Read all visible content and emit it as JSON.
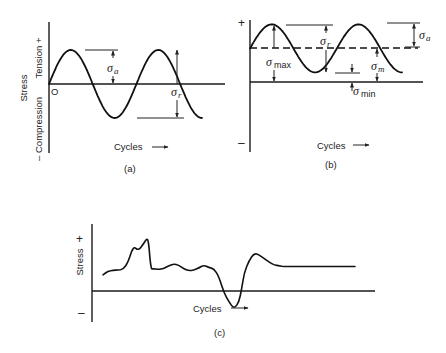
{
  "figure": {
    "panels": [
      {
        "id": "a",
        "caption": "(a)",
        "title": "Completely reversed stress cycle",
        "y_axis": {
          "label": "Stress",
          "positive_label": "Tension +",
          "negative_label": "– Compression"
        },
        "x_axis": {
          "label": "Cycles",
          "arrow": "→"
        },
        "origin_label": "O",
        "annotations": [
          {
            "symbol": "σ",
            "subscript": "a",
            "meaning": "stress amplitude"
          },
          {
            "symbol": "σ",
            "subscript": "r",
            "meaning": "stress range"
          }
        ]
      },
      {
        "id": "b",
        "caption": "(b)",
        "title": "Fluctuating stress cycle with nonzero mean",
        "y_axis": {
          "positive_label": "+",
          "negative_label": "–"
        },
        "x_axis": {
          "label": "Cycles",
          "arrow": "→"
        },
        "annotations": [
          {
            "symbol": "σ",
            "subscript": "r",
            "meaning": "stress range"
          },
          {
            "symbol": "σ",
            "subscript": "a",
            "meaning": "stress amplitude"
          },
          {
            "symbol": "σ",
            "subscript": "max",
            "meaning": "maximum stress"
          },
          {
            "symbol": "σ",
            "subscript": "m",
            "meaning": "mean stress"
          },
          {
            "symbol": "σ",
            "subscript": "min",
            "meaning": "minimum stress"
          }
        ]
      },
      {
        "id": "c",
        "caption": "(c)",
        "title": "Random stress cycle",
        "y_axis": {
          "label": "Stress",
          "positive_label": "+",
          "negative_label": "–"
        },
        "x_axis": {
          "label": "Cycles",
          "arrow": "→"
        }
      }
    ]
  },
  "chart_data": [
    {
      "type": "line",
      "panel": "a",
      "function": "sine",
      "cycles": 1.75,
      "mean": 0,
      "amplitude": 1,
      "xlabel": "Cycles",
      "ylabel": "Stress",
      "ylim": [
        -1.3,
        1.8
      ],
      "grid": false
    },
    {
      "type": "line",
      "panel": "b",
      "function": "sine",
      "cycles": 1.75,
      "mean": 1.4,
      "amplitude": 1,
      "min": 0.4,
      "max": 2.4,
      "xlabel": "Cycles",
      "ylabel": "",
      "ylim": [
        -2.9,
        2.5
      ],
      "grid": false
    },
    {
      "type": "line",
      "panel": "c",
      "description": "irregular random stress history",
      "x": [
        0,
        2,
        4,
        6,
        8,
        10,
        12,
        14,
        16,
        17,
        18,
        19,
        20,
        22,
        24,
        26,
        28,
        30,
        32,
        34,
        36,
        38,
        40,
        42,
        44,
        46,
        48,
        50,
        52,
        54,
        55,
        56,
        58,
        60,
        62,
        64,
        66,
        68,
        70,
        72,
        74,
        76,
        78,
        80,
        82,
        84,
        86,
        88,
        90,
        92,
        94,
        96,
        98,
        100
      ],
      "y": [
        0.45,
        0.55,
        0.58,
        0.58,
        0.6,
        0.8,
        1.25,
        1.12,
        1.3,
        1.42,
        1.45,
        0.6,
        0.62,
        0.6,
        0.62,
        0.7,
        0.75,
        0.72,
        0.62,
        0.56,
        0.58,
        0.64,
        0.72,
        0.65,
        0.62,
        0.4,
        -0.05,
        -0.3,
        -0.5,
        -0.3,
        0.05,
        0.5,
        0.85,
        1.05,
        1.0,
        0.9,
        0.8,
        0.72,
        0.7,
        0.68,
        0.68,
        0.68,
        0.68,
        0.68,
        0.68,
        0.68,
        0.68,
        0.68,
        0.68,
        0.68,
        0.68,
        0.68,
        0.68,
        0.68
      ],
      "xlabel": "Cycles",
      "ylabel": "Stress",
      "ylim": [
        -0.9,
        1.8
      ],
      "grid": false
    }
  ]
}
